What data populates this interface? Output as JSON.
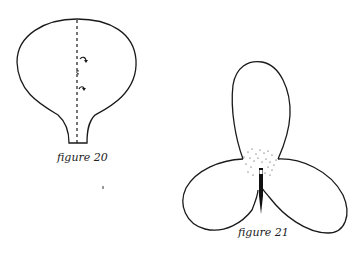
{
  "figures": [
    {
      "id": "figure-20",
      "caption": "figure 20",
      "subject": "single petal with dashed fold line and fold arrows",
      "fold_arrows": 2
    },
    {
      "id": "figure-21",
      "caption": "figure 21",
      "subject": "three-petal flower with stippled center and stamen"
    }
  ],
  "colors": {
    "ink": "#1a1a1a",
    "paper": "#ffffff"
  }
}
